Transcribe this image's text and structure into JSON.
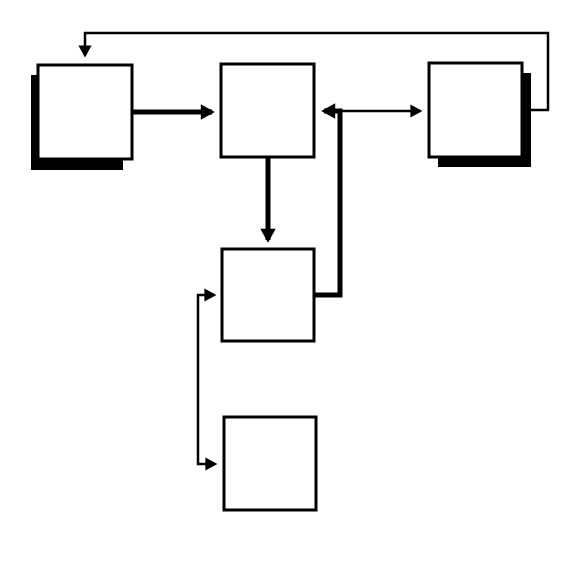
{
  "diagram": {
    "width": 581,
    "height": 568,
    "background": "#ffffff",
    "stroke_color": "#000000",
    "box_fill": "#ffffff",
    "boxes": [
      {
        "id": "box-1",
        "x": 38,
        "y": 65,
        "w": 94,
        "h": 94,
        "shadow": "bottom-left"
      },
      {
        "id": "box-2",
        "x": 221,
        "y": 64,
        "w": 93,
        "h": 93,
        "shadow": "none"
      },
      {
        "id": "box-3",
        "x": 429,
        "y": 63,
        "w": 93,
        "h": 94,
        "shadow": "bottom-right"
      },
      {
        "id": "box-4",
        "x": 222,
        "y": 249,
        "w": 92,
        "h": 92,
        "shadow": "none"
      },
      {
        "id": "box-5",
        "x": 224,
        "y": 417,
        "w": 92,
        "h": 93,
        "shadow": "none"
      }
    ],
    "connectors": [
      {
        "id": "box1-to-box2",
        "weight": "thick",
        "points": [
          [
            132,
            112
          ],
          [
            212,
            112
          ]
        ],
        "arrow_end": true,
        "arrow_start": false
      },
      {
        "id": "box2-to-box4",
        "weight": "thick",
        "points": [
          [
            268,
            157
          ],
          [
            268,
            240
          ]
        ],
        "arrow_end": true,
        "arrow_start": false
      },
      {
        "id": "box4-to-box2",
        "weight": "thick",
        "points": [
          [
            314,
            295
          ],
          [
            340,
            295
          ],
          [
            340,
            111
          ],
          [
            324,
            111
          ]
        ],
        "arrow_end": true,
        "arrow_start": false
      },
      {
        "id": "box2-box3-bidirectional",
        "weight": "thin",
        "points": [
          [
            340,
            111
          ],
          [
            420,
            111
          ]
        ],
        "arrow_end": true,
        "arrow_start": false
      },
      {
        "id": "box3-to-box1-return",
        "weight": "thin",
        "points": [
          [
            522,
            110
          ],
          [
            548,
            110
          ],
          [
            548,
            33
          ],
          [
            85,
            33
          ],
          [
            85,
            55
          ]
        ],
        "arrow_end": true,
        "arrow_start": false
      },
      {
        "id": "box4-box5-bidirectional",
        "weight": "thin",
        "points": [
          [
            214,
            295
          ],
          [
            198,
            295
          ],
          [
            198,
            464
          ],
          [
            215,
            464
          ]
        ],
        "arrow_end": true,
        "arrow_start": true
      }
    ]
  }
}
